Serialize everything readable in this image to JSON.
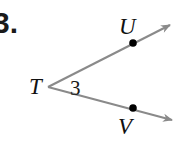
{
  "figure": {
    "problem_number": "3.",
    "background_color": "#ffffff",
    "ray_color": "#8a8a8a",
    "point_color": "#000000",
    "label_color": "#111111",
    "vertex": {
      "name": "vertex-T",
      "label": "T",
      "x": 48,
      "y": 87
    },
    "angle": {
      "name": "angle-3",
      "label": "3",
      "x": 72,
      "y": 88
    },
    "points": [
      {
        "name": "point-U",
        "label": "U",
        "x": 133,
        "y": 43,
        "label_x": 124,
        "label_y": 27
      },
      {
        "name": "point-V",
        "label": "V",
        "x": 133,
        "y": 108,
        "label_x": 124,
        "label_y": 130
      }
    ],
    "rays": [
      {
        "name": "ray-TU",
        "from_x": 48,
        "from_y": 87,
        "to_x": 176,
        "to_y": 22
      },
      {
        "name": "ray-TV",
        "from_x": 48,
        "from_y": 87,
        "to_x": 178,
        "to_y": 123
      }
    ]
  }
}
